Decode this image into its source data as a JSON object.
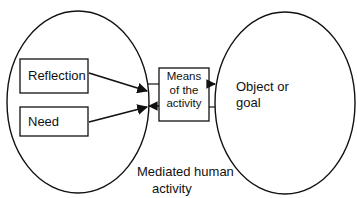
{
  "diagram": {
    "colors": {
      "stroke": "#111111",
      "background": "#ffffff",
      "text": "#111111"
    },
    "left_ellipse": {
      "label_line1": "Mediated human",
      "label_line2": "activity"
    },
    "boxes": {
      "reflection": "Reflection",
      "need": "Need",
      "means": {
        "line1": "Means",
        "line2": "of the",
        "line3": "activity"
      }
    },
    "right_ellipse": {
      "label_line1": "Object or",
      "label_line2": "goal"
    },
    "edges": [
      {
        "from": "Reflection",
        "to": "Means of the activity"
      },
      {
        "from": "Need",
        "to": "Means of the activity"
      },
      {
        "from": "Means of the activity",
        "to": "Object or goal"
      }
    ]
  }
}
